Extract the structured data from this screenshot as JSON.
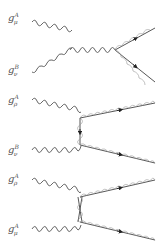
{
  "figure": {
    "colors": {
      "line": "#555555",
      "arrow": "#222222",
      "background": "#ffffff"
    }
  },
  "diagrams": [
    {
      "name": "s-channel",
      "labels": [
        {
          "base": "g",
          "sup": "A",
          "sub": "μ"
        },
        {
          "base": "g",
          "sup": "B",
          "sub": "ν"
        }
      ]
    },
    {
      "name": "t-channel",
      "labels": [
        {
          "base": "g",
          "sup": "A",
          "sub": "ρ"
        },
        {
          "base": "g",
          "sup": "B",
          "sub": "ν"
        }
      ]
    },
    {
      "name": "u-channel",
      "labels": [
        {
          "base": "g",
          "sup": "A",
          "sub": "ρ"
        },
        {
          "base": "g",
          "sup": "A",
          "sub": "μ"
        }
      ]
    }
  ]
}
